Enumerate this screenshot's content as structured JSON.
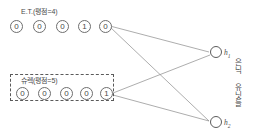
{
  "diagram": {
    "type": "restricted-boltzmann-machine-visible-hidden",
    "visible_groups": [
      {
        "id": "group-et",
        "caption": "E.T.(평점=4)",
        "caption_x": 21,
        "caption_y": 8,
        "boxed": false,
        "units": [
          {
            "value": "0",
            "x": 10,
            "y": 20
          },
          {
            "value": "0",
            "x": 33,
            "y": 20
          },
          {
            "value": "0",
            "x": 56,
            "y": 20
          },
          {
            "value": "1",
            "x": 78,
            "y": 20
          },
          {
            "value": "0",
            "x": 99,
            "y": 20
          }
        ]
      },
      {
        "id": "group-shrek",
        "caption": "슈렉(평점=5)",
        "caption_x": 21,
        "caption_y": 77,
        "boxed": true,
        "box": {
          "x": 10,
          "y": 74,
          "w": 104,
          "h": 27
        },
        "units": [
          {
            "value": "0",
            "x": 16,
            "y": 87
          },
          {
            "value": "0",
            "x": 38,
            "y": 87
          },
          {
            "value": "0",
            "x": 60,
            "y": 87
          },
          {
            "value": "0",
            "x": 80,
            "y": 87
          },
          {
            "value": "1",
            "x": 100,
            "y": 87
          }
        ]
      }
    ],
    "hidden_units": [
      {
        "id": "h1",
        "label": "h",
        "sub": "1",
        "cx": 216,
        "cy": 52
      },
      {
        "id": "h2",
        "label": "h",
        "sub": "2",
        "cx": 216,
        "cy": 122
      }
    ],
    "hidden_axis_caption": "은닉 유닛들",
    "hidden_axis_caption_x": 231,
    "hidden_axis_caption_y": 58,
    "edges": [
      {
        "from": "et-last",
        "x1": 110,
        "y1": 26,
        "x2": 209,
        "y2": 52
      },
      {
        "from": "et-last",
        "x1": 110,
        "y1": 27,
        "x2": 209,
        "y2": 121
      },
      {
        "from": "shrek-last",
        "x1": 113,
        "y1": 93,
        "x2": 210,
        "y2": 55
      },
      {
        "from": "shrek-last",
        "x1": 113,
        "y1": 95,
        "x2": 209,
        "y2": 121
      }
    ],
    "colors": {
      "stroke": "#8a8a8a",
      "unit_border": "#6e6e6e",
      "text": "#4a4a4a",
      "dashed_border": "#5a5a5a",
      "background": "#ffffff"
    }
  }
}
